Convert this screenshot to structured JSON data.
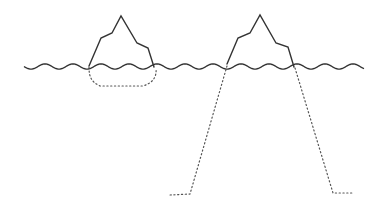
{
  "diagram": {
    "title": "",
    "colors": {
      "line": "#333333",
      "dotted_line": "#555555",
      "background": "#ffffff"
    },
    "elements": [
      {
        "id": "waterline",
        "type": "wavy-line",
        "style": "solid"
      },
      {
        "id": "iceberg-left-visible",
        "type": "iceberg-tip",
        "style": "solid"
      },
      {
        "id": "iceberg-left-submerged",
        "type": "submerged-part",
        "style": "dotted",
        "size": "small"
      },
      {
        "id": "iceberg-right-visible",
        "type": "iceberg-tip",
        "style": "solid"
      },
      {
        "id": "iceberg-right-submerged",
        "type": "submerged-part",
        "style": "dotted",
        "size": "large"
      }
    ]
  }
}
